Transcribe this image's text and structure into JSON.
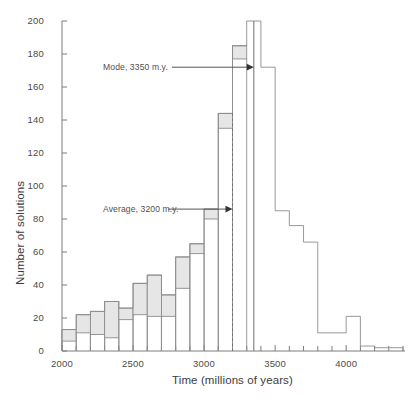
{
  "chart_data": {
    "type": "bar",
    "title": "",
    "xlabel": "Time (millions of years)",
    "ylabel": "Number of solutions",
    "xlim": [
      2000,
      4400
    ],
    "ylim": [
      0,
      200
    ],
    "grid": false,
    "legend_position": "none",
    "xticks_major": [
      2000,
      2500,
      3000,
      3500,
      4000
    ],
    "xtick_labels": [
      "2000",
      "2500",
      "3000",
      "3500",
      "4000"
    ],
    "xtick_minor_step": 100,
    "yticks": [
      0,
      20,
      40,
      60,
      80,
      100,
      120,
      140,
      160,
      180,
      200
    ],
    "ytick_labels": [
      "0",
      "20",
      "40",
      "60",
      "80",
      "100",
      "120",
      "140",
      "160",
      "180",
      "200"
    ],
    "bin_width": 100,
    "categories": [
      "2000-2100",
      "2100-2200",
      "2200-2300",
      "2300-2400",
      "2400-2500",
      "2500-2600",
      "2600-2700",
      "2700-2800",
      "2800-2900",
      "2900-3000",
      "3000-3100",
      "3100-3200",
      "3200-3300",
      "3300-3400",
      "3400-3500",
      "3500-3600",
      "3600-3700",
      "3700-3800",
      "3800-3900",
      "3900-4000",
      "4000-4100",
      "4100-4200",
      "4200-4300",
      "4300-4400"
    ],
    "values": [
      13,
      22,
      24,
      30,
      26,
      41,
      46,
      34,
      57,
      65,
      86,
      144,
      185,
      200,
      172,
      85,
      76,
      66,
      11,
      11,
      21,
      3,
      2,
      2
    ],
    "values_inner": [
      6,
      11,
      10,
      8,
      19,
      22,
      21,
      21,
      38,
      59,
      80,
      135,
      177,
      200,
      172,
      85,
      76,
      66,
      11,
      11,
      21,
      3,
      2,
      2
    ],
    "filled_through_bin": 13,
    "annotations": [
      {
        "name": "mode",
        "label": "Mode, 3350 m.y.",
        "value": 3350,
        "y": 172,
        "marker": "solid-line"
      },
      {
        "name": "average",
        "label": "Average, 3200 m.y.",
        "value": 3200,
        "y": 86,
        "marker": "dashed-line"
      }
    ],
    "colors": {
      "bar_fill": "#e6e6e6",
      "bar_edge": "#8c8c8c",
      "axis": "#7c7c7c",
      "text": "#3c3c3c",
      "annotation": "#4f4f4f"
    }
  },
  "axes": {
    "y_title": "Number of solutions",
    "x_title": "Time (millions of years)"
  }
}
